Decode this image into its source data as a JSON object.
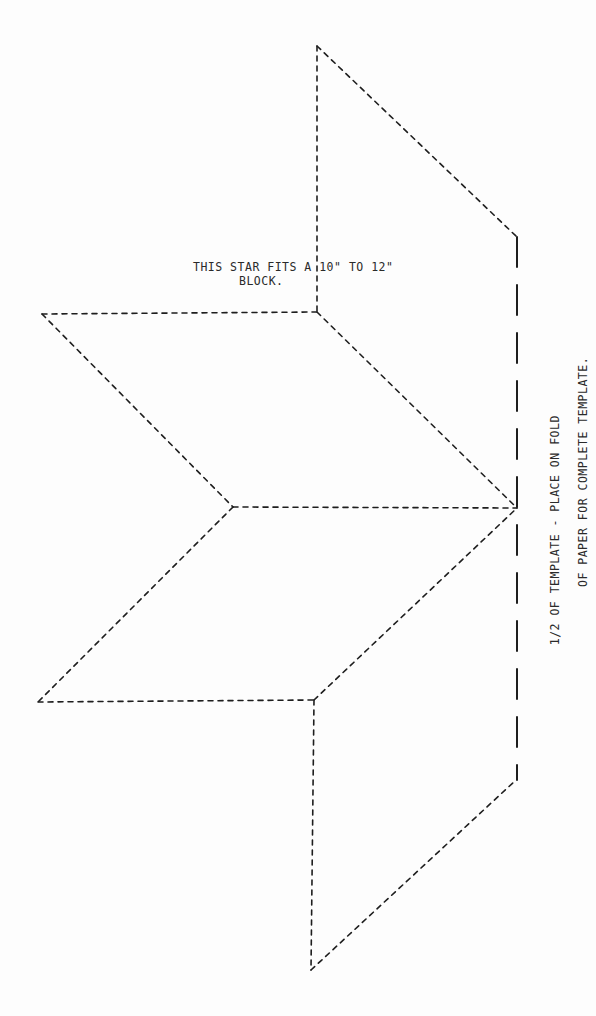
{
  "document": {
    "title": "Star quilt block template (half)",
    "note": {
      "line1": "THIS STAR FITS A 10\" TO 12\"",
      "line2": "BLOCK."
    },
    "fold_instruction": {
      "line1": "1/2 OF TEMPLATE - PLACE ON FOLD",
      "line2": "OF PAPER FOR COMPLETE TEMPLATE."
    },
    "colors": {
      "ink": "#1e1e1e",
      "paper": "#fdfdfd"
    }
  }
}
